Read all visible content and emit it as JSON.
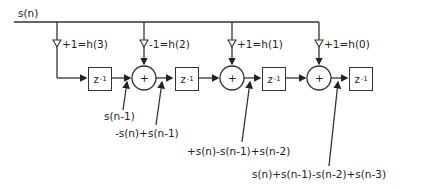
{
  "diagram": {
    "input_label": "s(n)",
    "taps": [
      {
        "label": "+1=h(3)"
      },
      {
        "label": "-1=h(2)"
      },
      {
        "label": "+1=h(1)"
      },
      {
        "label": "+1=h(0)"
      }
    ],
    "delay": {
      "base": "z",
      "exp": "-1"
    },
    "adder_symbol": "+",
    "signals": [
      "s(n-1)",
      "-s(n)+s(n-1)",
      "+s(n)-s(n-1)+s(n-2)",
      "s(n)+s(n-1)-s(n-2)+s(n-3)"
    ]
  }
}
